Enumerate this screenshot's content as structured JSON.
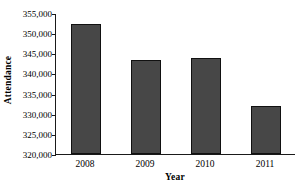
{
  "chart_data": {
    "type": "bar",
    "title": "",
    "xlabel": "Year",
    "ylabel": "Attendance",
    "categories": [
      "2008",
      "2009",
      "2010",
      "2011"
    ],
    "values": [
      352200,
      343300,
      343900,
      331800
    ],
    "ylim": [
      320000,
      355000
    ],
    "ytick_values": [
      320000,
      325000,
      330000,
      335000,
      340000,
      345000,
      350000,
      355000
    ],
    "ytick_labels": [
      "320,000",
      "325,000",
      "330,000",
      "335,000",
      "340,000",
      "345,000",
      "350,000",
      "355,000"
    ],
    "grid": false,
    "legend": null,
    "bar_color": "#474747",
    "bar_border_color": "#111111",
    "axis_color": "#1a1a1a",
    "background_color": "#ffffff"
  }
}
